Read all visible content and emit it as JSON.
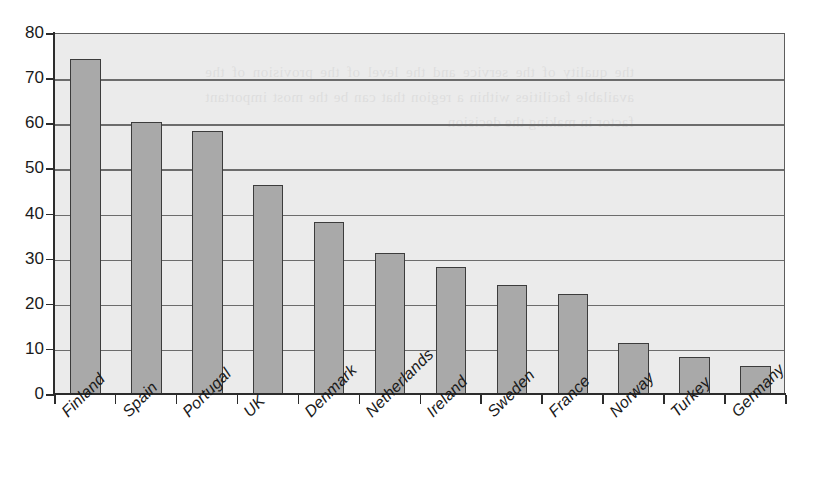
{
  "chart_data": {
    "type": "bar",
    "title": "",
    "subtitle": "",
    "xlabel": "",
    "ylabel": "",
    "categories": [
      "Finland",
      "Spain",
      "Portugal",
      "UK",
      "Denmark",
      "Netherlands",
      "Ireland",
      "Sweden",
      "France",
      "Norway",
      "Turkey",
      "Germany"
    ],
    "values": [
      74,
      60,
      58,
      46,
      38,
      31,
      28,
      24,
      22,
      11,
      8,
      6
    ],
    "ylim": [
      0,
      80
    ],
    "ytick_labels": [
      "80",
      "70",
      "60",
      "50",
      "40",
      "30",
      "20",
      "10",
      "0"
    ],
    "ytick_values": [
      80,
      70,
      60,
      50,
      40,
      30,
      20,
      10,
      0
    ],
    "y_tick_step": 10,
    "grid": true,
    "grid_axis": "y",
    "legend": false,
    "legend_position": "none",
    "bar_color": "#a9a9a9",
    "bar_border_color": "#3c3c3c",
    "plot_background_color": "#ebebeb",
    "gridline_color": "#6c6c6c",
    "axis_color": "#2c2c2c",
    "text_color": "#1a1a1a",
    "xlabel_rotation": -45
  },
  "bleed_text": "the quality of the service and the level of the provision of the available facilities within a region that can be the most important factor in making the decision"
}
